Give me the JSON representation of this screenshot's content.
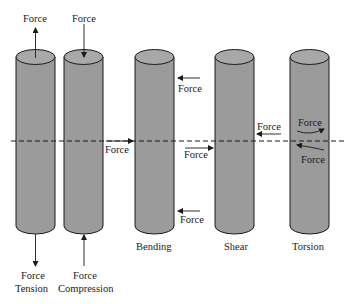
{
  "diagram": {
    "colors": {
      "cylinder_fill": "#9b9b9b",
      "cylinder_top": "#a8a8a8",
      "outline": "#1a1a1a",
      "background": "#ffffff"
    },
    "neutral_axis": {
      "style": "dashed"
    },
    "members": [
      {
        "id": "tension",
        "caption": "Tension",
        "top_label": "Force",
        "bottom_label": "Force"
      },
      {
        "id": "compression",
        "caption": "Compression",
        "top_label": "Force",
        "bottom_label": "Force"
      },
      {
        "id": "bending",
        "caption": "Bending",
        "left_label": "Force",
        "upper_right_label": "Force",
        "lower_right_label": "Force"
      },
      {
        "id": "shear",
        "caption": "Shear",
        "left_label": "Force",
        "right_label": "Force"
      },
      {
        "id": "torsion",
        "caption": "Torsion",
        "upper_label": "Force",
        "lower_label": "Force"
      }
    ]
  }
}
